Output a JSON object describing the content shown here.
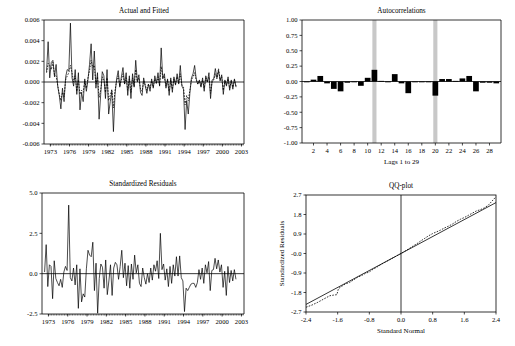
{
  "figure": {
    "width": 515,
    "height": 346,
    "background": "#ffffff",
    "ink": "#000000",
    "band_color": "#c8c8c8"
  },
  "chart_data": [
    {
      "id": "actual-and-fitted",
      "type": "line",
      "title": "Actual and Fitted",
      "xlabel": "",
      "ylabel": "",
      "xlim": [
        1972.0,
        2003.4
      ],
      "ylim": [
        -0.006,
        0.006
      ],
      "yticks": [
        0.006,
        0.004,
        0.002,
        0.0,
        -0.002,
        -0.004,
        -0.006
      ],
      "ytick_labels": [
        "0.006",
        "0.004",
        "0.002",
        "0.000",
        "-0.002",
        "-0.004",
        "-0.006"
      ],
      "xticks": [
        1973,
        1976,
        1979,
        1982,
        1985,
        1988,
        1991,
        1994,
        1997,
        2000,
        2003
      ],
      "xtick_labels": [
        "1973",
        "1976",
        "1979",
        "1982",
        "1985",
        "1988",
        "1991",
        "1994",
        "1997",
        "2000",
        "2003"
      ],
      "grid": false,
      "legend": [],
      "zero_line": 0.0,
      "series": [
        {
          "name": "Actual",
          "style": "solid",
          "x_start": 1972.4,
          "x_step": 0.25,
          "values": [
            0.001,
            0.0039,
            0.0004,
            0.0019,
            0.0021,
            0.0005,
            0.0017,
            -0.0004,
            -0.0013,
            -0.0026,
            -0.0006,
            -0.0019,
            0.0005,
            0.0012,
            0.0011,
            0.0057,
            0.0004,
            -0.0004,
            0.0012,
            -0.0012,
            0.0009,
            -0.0027,
            -0.001,
            -0.0019,
            0.0003,
            -0.0009,
            0.0002,
            0.0017,
            0.0037,
            0.0002,
            0.003,
            -0.0006,
            0.0009,
            -0.0036,
            -0.0012,
            0.001,
            0.0006,
            -0.0016,
            0.0012,
            -0.0031,
            -0.0019,
            -0.0009,
            -0.0048,
            -0.0012,
            0.0003,
            0.0011,
            -0.0005,
            0.0005,
            0.0014,
            -0.0002,
            0.0009,
            -0.0013,
            0.0006,
            -0.0016,
            0.0008,
            -0.0005,
            0.0021,
            0.0001,
            0.0007,
            -0.001,
            -0.0013,
            0.0004,
            -0.0004,
            -0.0011,
            -0.0002,
            -0.0009,
            0.0003,
            -0.0006,
            0.0006,
            -0.0001,
            0.0009,
            -0.0004,
            0.0033,
            0.0003,
            0.0008,
            -0.0006,
            0.0003,
            -0.0013,
            0.0004,
            -0.001,
            0.0005,
            -0.0003,
            0.0008,
            -0.0002,
            0.0016,
            -0.0004,
            -0.0007,
            -0.0046,
            -0.0018,
            -0.0031,
            -0.0011,
            0.0004,
            0.0008,
            0.0016,
            0.0003,
            -0.0002,
            0.0002,
            -0.0005,
            0.0004,
            -0.0009,
            0.0006,
            0.0,
            0.0009,
            -0.0016,
            0.0002,
            0.0003,
            0.0013,
            0.0004,
            0.0011,
            0.0001,
            0.0007,
            -0.0012,
            0.0002,
            -0.0004,
            0.0005,
            -0.0008,
            0.0002,
            -0.0007,
            0.0003,
            -0.0005
          ]
        },
        {
          "name": "Fitted",
          "style": "dashed",
          "x_start": 1972.4,
          "x_step": 0.25,
          "values": [
            0.0009,
            0.0018,
            0.0016,
            0.0012,
            0.0019,
            0.0007,
            0.0006,
            -0.0003,
            -0.0012,
            -0.0018,
            -0.001,
            -0.0014,
            0.0002,
            0.0006,
            0.0009,
            0.0016,
            0.0009,
            0.0,
            0.0006,
            -0.0009,
            0.0002,
            -0.0012,
            -0.0008,
            -0.001,
            0.0001,
            -0.0006,
            0.0004,
            0.0011,
            0.0021,
            0.0014,
            0.0016,
            -0.0002,
            0.0005,
            -0.0015,
            -0.0008,
            0.0005,
            0.0002,
            -0.001,
            0.0004,
            -0.0018,
            -0.0013,
            -0.0007,
            -0.0025,
            -0.0008,
            0.0001,
            0.0006,
            -0.0004,
            0.0002,
            0.0008,
            -0.0002,
            0.0004,
            -0.0008,
            0.0003,
            -0.001,
            0.0004,
            -0.0004,
            0.0012,
            0.0,
            0.0004,
            -0.0007,
            -0.0009,
            0.0001,
            -0.0003,
            -0.0008,
            -0.0002,
            -0.0006,
            0.0001,
            -0.0005,
            0.0003,
            -0.0002,
            0.0005,
            -0.0003,
            0.0015,
            0.0004,
            0.0005,
            -0.0004,
            0.0002,
            -0.0009,
            0.0002,
            -0.0007,
            0.0003,
            -0.0002,
            0.0005,
            -0.0001,
            0.0008,
            -0.0003,
            -0.0005,
            -0.0022,
            -0.0013,
            -0.0018,
            -0.0008,
            0.0002,
            0.0005,
            0.0009,
            0.0002,
            -0.0002,
            0.0001,
            -0.0004,
            0.0002,
            -0.0006,
            0.0004,
            0.0,
            0.0005,
            -0.0011,
            0.0001,
            0.0002,
            0.0008,
            0.0003,
            0.0013,
            0.0002,
            0.0005,
            -0.0008,
            0.0001,
            -0.0003,
            0.0003,
            -0.0006,
            0.0001,
            -0.0005,
            0.0002,
            -0.0004
          ]
        }
      ]
    },
    {
      "id": "autocorrelations",
      "type": "bar",
      "title": "Autocorrelations",
      "xlabel": "Lags 1 to 29",
      "ylabel": "",
      "xlim": [
        0.3,
        29.7
      ],
      "ylim": [
        -1.0,
        1.0
      ],
      "yticks": [
        1.0,
        0.75,
        0.5,
        0.25,
        0.0,
        -0.25,
        -0.5,
        -0.75,
        -1.0
      ],
      "ytick_labels": [
        "1.00",
        "0.75",
        "0.50",
        "0.25",
        "0.00",
        "-0.25",
        "-0.50",
        "-0.75",
        "-1.00"
      ],
      "xticks": [
        2,
        4,
        6,
        8,
        10,
        12,
        14,
        16,
        18,
        20,
        22,
        24,
        26,
        28
      ],
      "xtick_labels": [
        "2",
        "4",
        "6",
        "8",
        "10",
        "12",
        "14",
        "16",
        "18",
        "20",
        "22",
        "24",
        "26",
        "28"
      ],
      "grid": false,
      "zero_line": 0.0,
      "highlight_bands": [
        11,
        20
      ],
      "categories": [
        1,
        2,
        3,
        4,
        5,
        6,
        7,
        8,
        9,
        10,
        11,
        12,
        13,
        14,
        15,
        16,
        17,
        18,
        19,
        20,
        21,
        22,
        23,
        24,
        25,
        26,
        27,
        28,
        29
      ],
      "values": [
        -0.01,
        0.03,
        0.09,
        -0.03,
        -0.12,
        -0.16,
        -0.02,
        -0.01,
        -0.07,
        0.06,
        0.19,
        0.01,
        -0.01,
        0.12,
        -0.03,
        -0.19,
        -0.01,
        -0.01,
        0.0,
        -0.23,
        0.04,
        0.04,
        0.01,
        0.05,
        0.09,
        -0.16,
        -0.02,
        -0.02,
        -0.03
      ]
    },
    {
      "id": "standardized-residuals",
      "type": "line",
      "title": "Standardized Residuals",
      "xlabel": "",
      "ylabel": "",
      "xlim": [
        1972.0,
        2003.4
      ],
      "ylim": [
        -2.5,
        5.0
      ],
      "yticks": [
        5.0,
        2.5,
        0.0,
        -2.5
      ],
      "ytick_labels": [
        "5.0",
        "2.5",
        "0.0",
        "-2.5"
      ],
      "xticks": [
        1973,
        1976,
        1979,
        1982,
        1985,
        1988,
        1991,
        1994,
        1997,
        2000,
        2003
      ],
      "xtick_labels": [
        "1973",
        "1976",
        "1979",
        "1982",
        "1985",
        "1988",
        "1991",
        "1994",
        "1997",
        "2000",
        "2003"
      ],
      "grid": false,
      "zero_line": 0.0,
      "series": [
        {
          "name": "Standardized Residuals",
          "style": "solid",
          "x_start": 1972.4,
          "x_step": 0.25,
          "values": [
            0.1,
            1.8,
            -0.8,
            0.55,
            0.45,
            -1.55,
            0.8,
            -0.3,
            -0.55,
            -0.75,
            -0.35,
            -0.85,
            0.1,
            0.45,
            0.2,
            4.25,
            -0.25,
            -0.45,
            0.35,
            -0.7,
            0.55,
            -2.15,
            0.3,
            -1.75,
            -1.25,
            -1.45,
            0.3,
            1.45,
            1.15,
            1.05,
            1.95,
            -1.05,
            0.65,
            -2.45,
            -0.3,
            0.6,
            0.4,
            -0.9,
            0.85,
            -1.3,
            -0.45,
            0.55,
            -1.35,
            0.35,
            0.7,
            0.55,
            -0.35,
            0.45,
            1.45,
            -0.25,
            0.65,
            -0.75,
            0.5,
            -0.9,
            0.6,
            -0.35,
            1.15,
            0.05,
            0.55,
            -0.6,
            -0.8,
            0.35,
            -0.25,
            -0.65,
            0.0,
            -0.55,
            0.35,
            -0.4,
            0.55,
            0.15,
            0.8,
            -0.3,
            2.5,
            0.25,
            0.6,
            -0.4,
            0.3,
            -0.8,
            0.45,
            -0.6,
            0.55,
            -0.15,
            1.05,
            -0.15,
            1.1,
            -0.25,
            -0.45,
            -2.35,
            -0.9,
            -1.05,
            -0.85,
            -0.65,
            -0.6,
            -0.6,
            -0.85,
            -0.55,
            0.25,
            -0.35,
            0.35,
            -0.6,
            0.55,
            0.05,
            0.75,
            -1.05,
            0.2,
            0.25,
            0.95,
            0.3,
            0.85,
            0.1,
            0.55,
            -0.85,
            0.15,
            -1.35,
            0.45,
            -0.55,
            0.2,
            -0.45,
            0.25,
            -0.35
          ]
        }
      ]
    },
    {
      "id": "qq-plot",
      "type": "scatter",
      "title": "QQ-plot",
      "xlabel": "Standard Normal",
      "ylabel": "Standardized Residuals",
      "xlim": [
        -2.4,
        2.4
      ],
      "ylim": [
        -2.7,
        2.7
      ],
      "yticks": [
        2.7,
        1.8,
        0.9,
        0.0,
        -0.9,
        -1.8,
        -2.7
      ],
      "ytick_labels": [
        "2.7",
        "1.8",
        "0.9",
        "-0.0",
        "-0.9",
        "-1.8",
        "-2.7"
      ],
      "xticks": [
        -2.4,
        -1.6,
        -0.8,
        0.0,
        0.8,
        1.6,
        2.4
      ],
      "xtick_labels": [
        "-2.4",
        "-1.6",
        "-0.8",
        "0.0",
        "0.8",
        "1.6",
        "2.4"
      ],
      "grid": false,
      "crosshair": {
        "x": 0.0,
        "y": 0.0
      },
      "reference_line": {
        "style": "solid",
        "points": [
          [
            -2.4,
            -2.35
          ],
          [
            2.4,
            2.35
          ]
        ]
      },
      "series": [
        {
          "name": "Sample Quantiles",
          "style": "dashed",
          "x": [
            -2.4,
            -2.25,
            -2.1,
            -1.95,
            -1.8,
            -1.7,
            -1.62,
            -1.58,
            -1.5,
            -1.4,
            -1.3,
            -1.2,
            -1.1,
            -1.0,
            -0.9,
            -0.8,
            -0.7,
            -0.6,
            -0.5,
            -0.4,
            -0.3,
            -0.2,
            -0.1,
            0.0,
            0.1,
            0.2,
            0.3,
            0.4,
            0.5,
            0.6,
            0.7,
            0.8,
            0.9,
            1.0,
            1.1,
            1.2,
            1.3,
            1.4,
            1.5,
            1.6,
            1.7,
            1.8,
            1.9,
            2.0,
            2.1,
            2.2,
            2.3,
            2.4
          ],
          "values": [
            -2.48,
            -2.38,
            -2.25,
            -2.1,
            -1.95,
            -1.92,
            -1.9,
            -1.62,
            -1.52,
            -1.4,
            -1.34,
            -1.22,
            -1.1,
            -1.02,
            -0.92,
            -0.85,
            -0.72,
            -0.62,
            -0.5,
            -0.4,
            -0.3,
            -0.2,
            -0.1,
            0.0,
            0.11,
            0.22,
            0.34,
            0.45,
            0.58,
            0.7,
            0.82,
            0.92,
            1.0,
            1.08,
            1.18,
            1.26,
            1.36,
            1.48,
            1.58,
            1.66,
            1.76,
            1.86,
            1.96,
            2.02,
            2.1,
            2.22,
            2.42,
            2.62
          ]
        }
      ]
    }
  ]
}
